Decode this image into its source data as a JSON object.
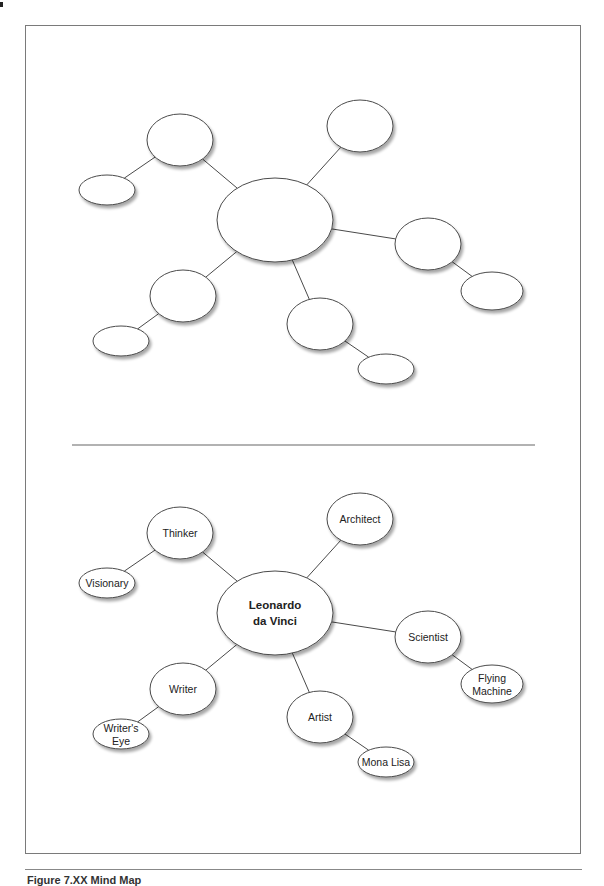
{
  "figure": {
    "caption": "Figure 7.XX   Mind Map"
  },
  "blank_map": {
    "title": "blank-mind-map-template",
    "nodes": [
      {
        "id": "center",
        "label": ""
      },
      {
        "id": "thinker",
        "label": ""
      },
      {
        "id": "visionary",
        "label": ""
      },
      {
        "id": "architect",
        "label": ""
      },
      {
        "id": "scientist",
        "label": ""
      },
      {
        "id": "flying-machine",
        "label": ""
      },
      {
        "id": "writer",
        "label": ""
      },
      {
        "id": "writers-eye",
        "label": ""
      },
      {
        "id": "artist",
        "label": ""
      },
      {
        "id": "mona-lisa",
        "label": ""
      }
    ]
  },
  "filled_map": {
    "center": {
      "lines": [
        "Leonardo",
        "da Vinci"
      ]
    },
    "branches": [
      {
        "id": "thinker",
        "lines": [
          "Thinker"
        ],
        "children": [
          {
            "id": "visionary",
            "lines": [
              "Visionary"
            ]
          }
        ]
      },
      {
        "id": "architect",
        "lines": [
          "Architect"
        ],
        "children": []
      },
      {
        "id": "scientist",
        "lines": [
          "Scientist"
        ],
        "children": [
          {
            "id": "flying-machine",
            "lines": [
              "Flying",
              "Machine"
            ]
          }
        ]
      },
      {
        "id": "writer",
        "lines": [
          "Writer"
        ],
        "children": [
          {
            "id": "writers-eye",
            "lines": [
              "Writer's",
              "Eye"
            ]
          }
        ]
      },
      {
        "id": "artist",
        "lines": [
          "Artist"
        ],
        "children": [
          {
            "id": "mona-lisa",
            "lines": [
              "Mona Lisa"
            ]
          }
        ]
      }
    ]
  },
  "colors": {
    "stroke": "#4a4a4a",
    "fill": "#ffffff",
    "shadow": "#b5b5b5",
    "frame": "#7a7a7a"
  }
}
